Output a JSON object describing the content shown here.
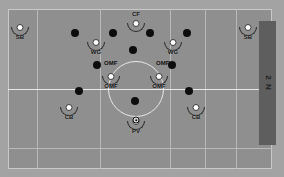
{
  "diagram": {
    "field": {
      "background_color": "#8f8f8f",
      "line_color": "#e9e9e9",
      "grid_color": "#b9b9b9",
      "margin_color": "#a3a3a3"
    },
    "side_panel": {
      "label": "2 N",
      "color": "#5e5e5e"
    },
    "ball": {
      "name": "ball",
      "x": 135,
      "y": 120
    },
    "team_players": [
      {
        "label": "SB",
        "x": 20,
        "y": 33,
        "name": "player-sb-left"
      },
      {
        "label": "CF",
        "x": 136,
        "y": 29,
        "name": "player-cf"
      },
      {
        "label": "SB",
        "x": 248,
        "y": 33,
        "name": "player-sb-right"
      },
      {
        "label": "WG",
        "x": 96,
        "y": 48,
        "name": "player-wg-left"
      },
      {
        "label": "WG",
        "x": 173,
        "y": 48,
        "name": "player-wg-right"
      },
      {
        "label": "OMF",
        "x": 111,
        "y": 82,
        "name": "player-omf-left"
      },
      {
        "label": "OMF",
        "x": 159,
        "y": 82,
        "name": "player-omf-right"
      },
      {
        "label": "CB",
        "x": 69,
        "y": 113,
        "name": "player-cb-left"
      },
      {
        "label": "CB",
        "x": 196,
        "y": 113,
        "name": "player-cb-right"
      },
      {
        "label": "PV",
        "x": 136,
        "y": 127,
        "name": "player-pv"
      }
    ],
    "opponent_players": [
      {
        "x": 75,
        "y": 33,
        "name": "opponent-marker"
      },
      {
        "x": 113,
        "y": 33,
        "name": "opponent-marker"
      },
      {
        "x": 150,
        "y": 33,
        "name": "opponent-marker"
      },
      {
        "x": 187,
        "y": 33,
        "name": "opponent-marker"
      },
      {
        "x": 133,
        "y": 50,
        "name": "opponent-marker"
      },
      {
        "x": 97,
        "y": 65,
        "name": "opponent-marker"
      },
      {
        "x": 172,
        "y": 65,
        "name": "opponent-marker"
      },
      {
        "x": 79,
        "y": 91,
        "name": "opponent-marker"
      },
      {
        "x": 189,
        "y": 91,
        "name": "opponent-marker"
      },
      {
        "x": 135,
        "y": 101,
        "name": "opponent-marker"
      }
    ],
    "grid": {
      "vertical_x": [
        37,
        100,
        170,
        205,
        236
      ],
      "horizontal_y": [
        148
      ]
    },
    "center_circle": {
      "cx": 136,
      "cy": 89,
      "r": 28
    },
    "halfway_line_y": 89,
    "legend": {
      "team_marker": "white-circle-with-arms",
      "opponent_marker": "black-dot",
      "positions": [
        "SB",
        "CF",
        "WG",
        "OMF",
        "CB",
        "PV"
      ]
    }
  }
}
